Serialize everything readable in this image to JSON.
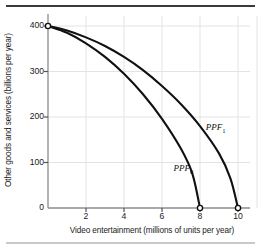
{
  "chart_data": {
    "type": "line",
    "title": "",
    "xlabel": "Video entertainment (millions of units per year)",
    "ylabel": "Other goods and services (billions per year)",
    "xlim": [
      0,
      11
    ],
    "ylim": [
      0,
      420
    ],
    "xticks": [
      "2",
      "4",
      "6",
      "8",
      "10"
    ],
    "xtick_values": [
      2,
      4,
      6,
      8,
      10
    ],
    "yticks": [
      "0",
      "100",
      "200",
      "300",
      "400"
    ],
    "ytick_values": [
      0,
      100,
      200,
      300,
      400
    ],
    "grid": true,
    "legend_position": "inline-annotation",
    "series": [
      {
        "name": "PPF0",
        "label": "PPF",
        "label_subscript": "0",
        "x": [
          0,
          1,
          2,
          3,
          4,
          5,
          6,
          7,
          7.6,
          8
        ],
        "values": [
          400,
          385,
          362,
          332,
          295,
          250,
          196,
          130,
          75,
          0
        ],
        "endpoint_markers": [
          {
            "x": 0,
            "y": 400
          },
          {
            "x": 8,
            "y": 0
          }
        ]
      },
      {
        "name": "PPF1",
        "label": "PPF",
        "label_subscript": "1",
        "x": [
          0,
          1,
          2,
          3,
          4,
          5,
          6,
          7,
          8,
          9,
          9.6,
          10
        ],
        "values": [
          400,
          390,
          375,
          356,
          332,
          303,
          268,
          228,
          180,
          120,
          65,
          0
        ],
        "endpoint_markers": [
          {
            "x": 0,
            "y": 400
          },
          {
            "x": 10,
            "y": 0
          }
        ]
      }
    ],
    "annotations": [
      {
        "name": "ppf1-label",
        "text": "PPF",
        "subscript": "1",
        "x": 8.3,
        "y": 175
      },
      {
        "name": "ppf0-label",
        "text": "PPF",
        "subscript": "0",
        "x": 6.6,
        "y": 85
      }
    ],
    "colors": {
      "curve": "#111111",
      "axis": "#8c8c8c",
      "grid": "#e3e3e3",
      "background": "#ffffff",
      "rule_top": "#3a3a3a",
      "rule_bottom": "#c9c9c9",
      "text": "#1a1a1a"
    }
  }
}
